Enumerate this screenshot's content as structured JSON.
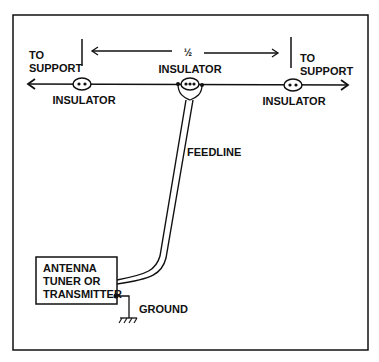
{
  "diagram": {
    "type": "dipole antenna feed diagram",
    "colors": {
      "line": "#111111",
      "background": "#ffffff"
    },
    "labels": {
      "left_support": [
        "TO",
        "SUPPORT"
      ],
      "right_support": [
        "TO",
        "SUPPORT"
      ],
      "half_wave": "½",
      "center_insulator": "INSULATOR",
      "left_insulator": "INSULATOR",
      "right_insulator": "INSULATOR",
      "feedline": "FEEDLINE",
      "tuner_box": [
        "ANTENNA",
        "TUNER OR",
        "TRANSMITTER"
      ],
      "ground": "GROUND"
    }
  }
}
